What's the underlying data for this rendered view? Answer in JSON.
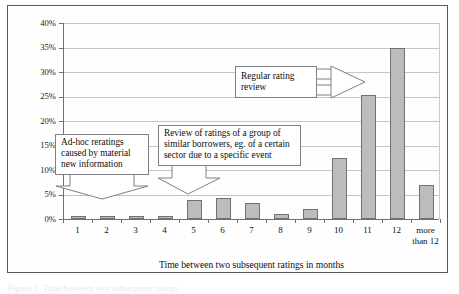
{
  "figure": {
    "caption_fragment": "Figure 1: Time between two subsequent ratings"
  },
  "chart_data": {
    "type": "bar",
    "title": "",
    "xlabel": "Time between two subsequent ratings in months",
    "ylabel": "Ratio of rerated clients",
    "categories": [
      "1",
      "2",
      "3",
      "4",
      "5",
      "6",
      "7",
      "8",
      "9",
      "10",
      "11",
      "12",
      "more than 12"
    ],
    "values": [
      0.4,
      0.5,
      0.4,
      0.6,
      3.8,
      4.3,
      3.2,
      1.1,
      2.1,
      12.4,
      25.3,
      35.0,
      7.0
    ],
    "value_unit": "%",
    "ylim": [
      0,
      40
    ],
    "ytick_labels": [
      "0%",
      "5%",
      "10%",
      "15%",
      "20%",
      "25%",
      "30%",
      "35%",
      "40%"
    ],
    "ytick_values": [
      0,
      5,
      10,
      15,
      20,
      25,
      30,
      35,
      40
    ],
    "grid": true,
    "legend": "none",
    "bar_color": "#bcbcbc",
    "bar_edge_color": "#6f7174",
    "grid_color": "#c3c5c8",
    "axis_color": "#6d7074",
    "annotations": [
      {
        "id": "ad-hoc",
        "text": "Ad-hoc reratings caused by material new information",
        "lines": [
          "Ad-hoc reratings",
          "caused by material",
          "new information"
        ],
        "points_to": [
          "1",
          "2"
        ]
      },
      {
        "id": "group-review",
        "text": "Review of ratings of a group of similar borrowers, eg. of a certain sector due to a specific event",
        "lines": [
          "Review of ratings of a group of",
          "similar borrowers, eg. of a certain",
          "sector due to a specific event"
        ],
        "points_to": [
          "5",
          "6",
          "7"
        ]
      },
      {
        "id": "regular-review",
        "text": "Regular rating review",
        "lines": [
          "Regular rating",
          "review"
        ],
        "points_to": [
          "11",
          "12"
        ]
      }
    ]
  }
}
